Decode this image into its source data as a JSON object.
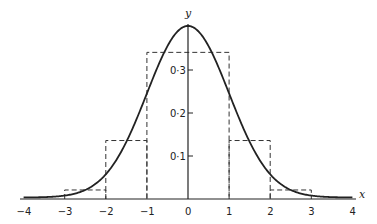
{
  "chart_data": {
    "type": "line",
    "title": "",
    "xlabel": "x",
    "ylabel": "y",
    "xlim": [
      -4,
      4
    ],
    "ylim": [
      0,
      0.4
    ],
    "grid": false,
    "legend": null,
    "x_ticks": [
      "−4",
      "−3",
      "−2",
      "−1",
      "0",
      "1",
      "2",
      "3",
      "4"
    ],
    "y_ticks": [
      "0·1",
      "0·2",
      "0·3"
    ],
    "series": [
      {
        "name": "standard normal density",
        "style": "solid",
        "function": "y = (1/sqrt(2*pi)) * exp(-x^2/2)",
        "x": [
          -4,
          -3,
          -2,
          -1,
          0,
          1,
          2,
          3,
          4
        ],
        "values": [
          0.0001,
          0.0044,
          0.054,
          0.242,
          0.399,
          0.242,
          0.054,
          0.0044,
          0.0001
        ]
      },
      {
        "name": "histogram (unit-width bins)",
        "style": "dashed",
        "bins": [
          {
            "from": -3,
            "to": -2,
            "height": 0.021
          },
          {
            "from": -2,
            "to": -1,
            "height": 0.136
          },
          {
            "from": -1,
            "to": 1,
            "height": 0.341
          },
          {
            "from": 1,
            "to": 2,
            "height": 0.136
          },
          {
            "from": 2,
            "to": 3,
            "height": 0.021
          }
        ]
      }
    ]
  },
  "axes": {
    "x_label": "x",
    "y_label": "y"
  }
}
